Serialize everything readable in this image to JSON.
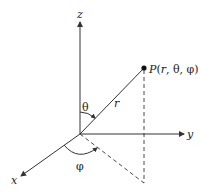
{
  "diagram": {
    "colors": {
      "line": "#333333",
      "background": "#ffffff"
    },
    "axes": {
      "z": {
        "label": "z"
      },
      "y": {
        "label": "y"
      },
      "x": {
        "label": "x"
      }
    },
    "point": {
      "label": "P(r, θ, φ)"
    },
    "radius": {
      "label": "r"
    },
    "angles": {
      "theta": {
        "label": "θ"
      },
      "phi": {
        "label": "φ"
      }
    }
  }
}
